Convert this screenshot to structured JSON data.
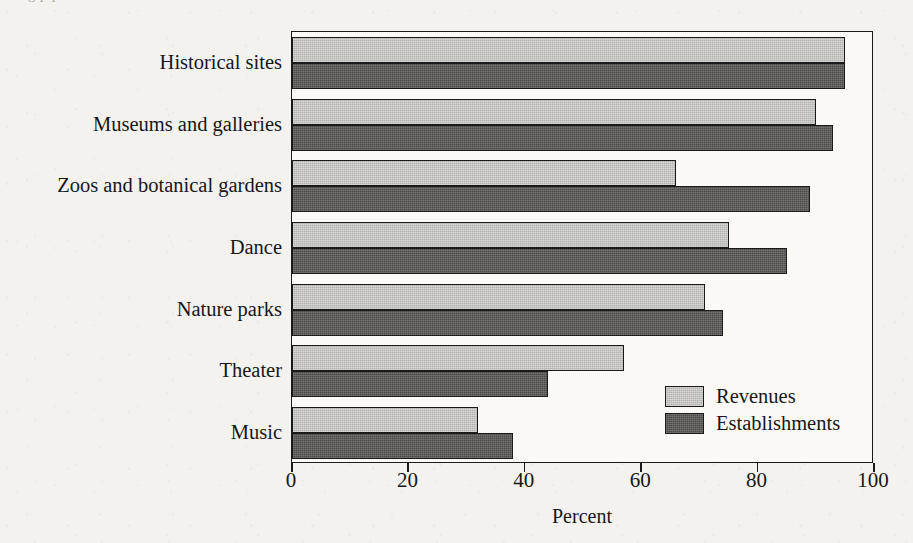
{
  "figure": {
    "background_color": "#f3f2ee",
    "plot_background_color": "#faf9f6",
    "axis_color": "#1a1a1a",
    "cut_off_title_fragment": "g                    p  p"
  },
  "legend": {
    "position": "inside-bottom-right",
    "entries": [
      {
        "label": "Revenues",
        "color": "#b4b3b0",
        "swatch_name": "legend-swatch-revenues"
      },
      {
        "label": "Establishments",
        "color": "#4c4b49",
        "swatch_name": "legend-swatch-establishments"
      }
    ]
  },
  "chart_data": {
    "type": "bar",
    "orientation": "horizontal",
    "title": "",
    "subtitle": "",
    "xlabel": "Percent",
    "ylabel": "",
    "xlim": [
      0,
      100
    ],
    "xticks": [
      0,
      20,
      40,
      60,
      80,
      100
    ],
    "xticklabels": [
      "0",
      "20",
      "40",
      "60",
      "80",
      "100"
    ],
    "grid": false,
    "legend_position": "inside-bottom-right",
    "categories": [
      "Historical sites",
      "Museums and galleries",
      "Zoos and botanical gardens",
      "Dance",
      "Nature parks",
      "Theater",
      "Music"
    ],
    "series": [
      {
        "name": "Revenues",
        "color": "#b4b3b0",
        "values": [
          95,
          90,
          66,
          75,
          71,
          57,
          32
        ]
      },
      {
        "name": "Establishments",
        "color": "#4c4b49",
        "values": [
          95,
          93,
          89,
          85,
          74,
          44,
          38
        ]
      }
    ]
  }
}
